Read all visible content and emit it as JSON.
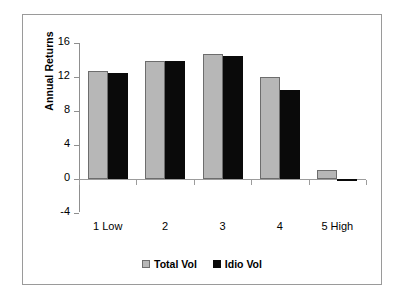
{
  "chart_data": {
    "type": "bar",
    "title": "",
    "xlabel": "",
    "ylabel": "Annual Returns",
    "categories": [
      "1 Low",
      "2",
      "3",
      "4",
      "5 High"
    ],
    "series": [
      {
        "name": "Total Vol",
        "color": "#b7b7b7",
        "values": [
          12.7,
          13.9,
          14.7,
          12.0,
          1.1
        ]
      },
      {
        "name": "Idio Vol",
        "color": "#0a0a0a",
        "values": [
          12.5,
          13.9,
          14.5,
          10.5,
          -0.1
        ]
      }
    ],
    "ylim": [
      -4,
      16
    ],
    "yticks": [
      16,
      12,
      8,
      4,
      0,
      -4
    ],
    "ytick_labels": [
      "16",
      "12",
      "8",
      "4",
      "0",
      "-4"
    ],
    "grid": false,
    "legend_position": "bottom",
    "frame": true
  }
}
